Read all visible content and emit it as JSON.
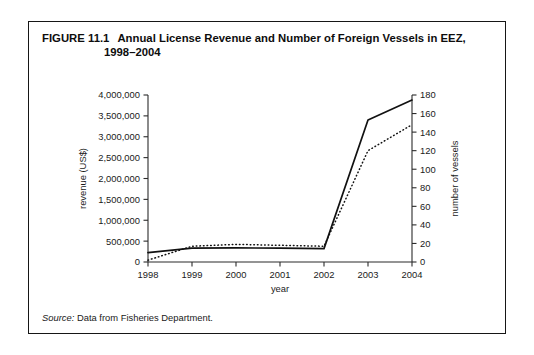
{
  "figure": {
    "number": "FIGURE 11.1",
    "title_line1": "Annual License Revenue and Number of Foreign Vessels in EEZ,",
    "title_line2": "1998–2004",
    "source_label": "Source:",
    "source_text": "Data from Fisheries Department."
  },
  "legend": {
    "revenue_label": "revenue",
    "vessels_label": "vessels"
  },
  "colors": {
    "ink": "#1a1a1a",
    "frame": "#161616",
    "axis": "#2b2b2b",
    "revenue_line": "#111111",
    "vessels_line": "#111111"
  },
  "chart_data": {
    "type": "line",
    "title": "Annual License Revenue and Number of Foreign Vessels in EEZ, 1998–2004",
    "xlabel": "year",
    "ylabel": "revenue (US$)",
    "y2label": "number of vessels",
    "grid": false,
    "legend_position": "bottom",
    "categories": [
      "1998",
      "1999",
      "2000",
      "2001",
      "2002",
      "2003",
      "2004"
    ],
    "x": [
      1998,
      1999,
      2000,
      2001,
      2002,
      2003,
      2004
    ],
    "xlim": [
      1998,
      2004
    ],
    "ylim": [
      0,
      4000000
    ],
    "y2lim": [
      0,
      180
    ],
    "yticks": [
      0,
      500000,
      1000000,
      1500000,
      2000000,
      2500000,
      3000000,
      3500000,
      4000000
    ],
    "ytick_labels": [
      "0",
      "500,000",
      "1,000,000",
      "1,500,000",
      "2,000,000",
      "2,500,000",
      "3,000,000",
      "3,500,000",
      "4,000,000"
    ],
    "y2ticks": [
      0,
      20,
      40,
      60,
      80,
      100,
      120,
      140,
      160,
      180
    ],
    "y2tick_labels": [
      "0",
      "20",
      "40",
      "60",
      "80",
      "100",
      "120",
      "140",
      "160",
      "180"
    ],
    "xtick_labels": [
      "1998",
      "1999",
      "2000",
      "2001",
      "2002",
      "2003",
      "2004"
    ],
    "series": [
      {
        "name": "revenue",
        "axis": "left",
        "style": "solid",
        "units": "US$",
        "values": [
          225000,
          330000,
          340000,
          330000,
          320000,
          3400000,
          3880000
        ]
      },
      {
        "name": "vessels",
        "axis": "right",
        "style": "dotted",
        "units": "vessels",
        "values": [
          2,
          17,
          19,
          18,
          17,
          120,
          148
        ]
      }
    ]
  }
}
